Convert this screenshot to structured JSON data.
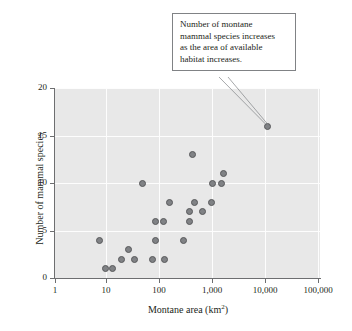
{
  "chart_data": {
    "type": "scatter",
    "title": "",
    "xlabel": "Montane area (km2)",
    "ylabel": "Number of mammal species",
    "xscale": "log",
    "yscale": "linear",
    "xlim": [
      1,
      100000
    ],
    "ylim": [
      0,
      20
    ],
    "grid": true,
    "legend": "none",
    "x_ticklabels": [
      "1",
      "10",
      "100",
      "1,000",
      "10,000",
      "100,000"
    ],
    "x_tickvalues": [
      1,
      10,
      100,
      1000,
      10000,
      100000
    ],
    "y_ticklabels": [
      "0",
      "5",
      "10",
      "15",
      "20"
    ],
    "y_tickvalues": [
      0,
      5,
      10,
      15,
      20
    ],
    "marker_color": "#808285",
    "marker_edge_color": "#58595b",
    "plot_background": "#e8e8e8",
    "gridline_color": "#fdfdfd",
    "points": [
      {
        "x": 7,
        "y": 4
      },
      {
        "x": 9,
        "y": 1
      },
      {
        "x": 12,
        "y": 1
      },
      {
        "x": 18,
        "y": 2
      },
      {
        "x": 24,
        "y": 3
      },
      {
        "x": 31,
        "y": 2
      },
      {
        "x": 45,
        "y": 10
      },
      {
        "x": 70,
        "y": 2
      },
      {
        "x": 78,
        "y": 6
      },
      {
        "x": 80,
        "y": 4
      },
      {
        "x": 110,
        "y": 6
      },
      {
        "x": 115,
        "y": 2
      },
      {
        "x": 145,
        "y": 8
      },
      {
        "x": 270,
        "y": 4
      },
      {
        "x": 340,
        "y": 7
      },
      {
        "x": 350,
        "y": 6
      },
      {
        "x": 400,
        "y": 13
      },
      {
        "x": 430,
        "y": 8
      },
      {
        "x": 600,
        "y": 7
      },
      {
        "x": 900,
        "y": 8
      },
      {
        "x": 950,
        "y": 10
      },
      {
        "x": 1400,
        "y": 10
      },
      {
        "x": 1500,
        "y": 11
      },
      {
        "x": 10000,
        "y": 16
      }
    ],
    "annotations": [
      {
        "text": "Number of montane mammal species increases as the area of available habitat increases.",
        "points_to_x": 10000,
        "points_to_y": 16
      }
    ]
  },
  "axes": {
    "y_title": "Number of mammal species",
    "x_title_main": "Montane area (km",
    "x_title_sup": "2",
    "x_title_tail": ")"
  },
  "annotation": {
    "line1": "Number of montane",
    "line2": "mammal species increases",
    "line3": "as the area of available",
    "line4": "habitat increases."
  }
}
